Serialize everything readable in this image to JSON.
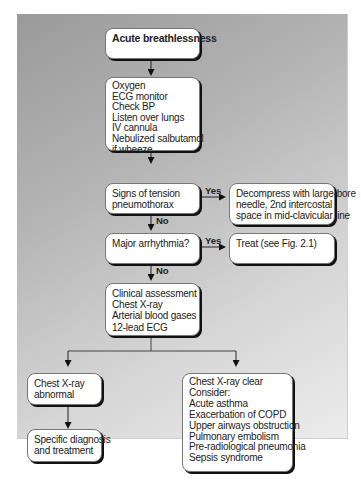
{
  "flowchart": {
    "start": {
      "lines": [
        "Acute breathlessness"
      ]
    },
    "initial": {
      "lines": [
        "Oxygen",
        "ECG monitor",
        "Check BP",
        "Listen over lungs",
        "IV cannula",
        "Nebulized salbutamol",
        "if wheeze"
      ]
    },
    "tension": {
      "lines": [
        "Signs of tension",
        "pneumothorax"
      ]
    },
    "decompress": {
      "lines": [
        "Decompress with large-bore",
        "needle, 2nd intercostal",
        "space in mid-clavicular line"
      ]
    },
    "arrhythmia": {
      "lines": [
        "Major arrhythmia?"
      ]
    },
    "treat": {
      "lines": [
        "Treat (see Fig. 2.1)"
      ]
    },
    "assessment": {
      "lines": [
        "Clinical assessment",
        "Chest X-ray",
        "Arterial blood gases",
        "12-lead ECG"
      ]
    },
    "xray_abnormal": {
      "lines": [
        "Chest X-ray",
        "abnormal"
      ]
    },
    "specific": {
      "lines": [
        "Specific diagnosis",
        "and treatment"
      ]
    },
    "xray_clear": {
      "lines": [
        "Chest X-ray clear",
        "Consider:",
        "Acute asthma",
        "Exacerbation of COPD",
        "Upper airways obstruction",
        "Pulmonary embolism",
        "Pre-radiological pneumonia",
        "Sepsis syndrome"
      ]
    },
    "labels": {
      "yes": "Yes",
      "no": "No"
    }
  }
}
